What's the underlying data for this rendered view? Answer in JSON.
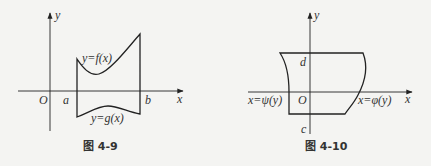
{
  "figures": [
    {
      "id": "fig-4-9",
      "caption": "图 4-9",
      "labels": {
        "origin": "O",
        "x_axis": "x",
        "y_axis": "y",
        "a": "a",
        "b": "b",
        "upper_curve": "y=f(x)",
        "lower_curve": "y=g(x)"
      }
    },
    {
      "id": "fig-4-10",
      "caption": "图 4-10",
      "labels": {
        "origin": "O",
        "x_axis": "x",
        "y_axis": "y",
        "d": "d",
        "c": "c",
        "left_curve": "x=ψ(y)",
        "right_curve": "x=φ(y)"
      }
    }
  ],
  "colors": {
    "stroke": "#222222",
    "background": "#f4f4f2"
  }
}
